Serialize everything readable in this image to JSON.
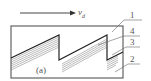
{
  "velocity": {
    "symbol": "v",
    "subscript": "d"
  },
  "panel_label": "(a)",
  "labels": [
    "1",
    "4",
    "3",
    "2"
  ],
  "colors": {
    "line": "#333333",
    "hatch": "#666666",
    "label": "#555555"
  }
}
